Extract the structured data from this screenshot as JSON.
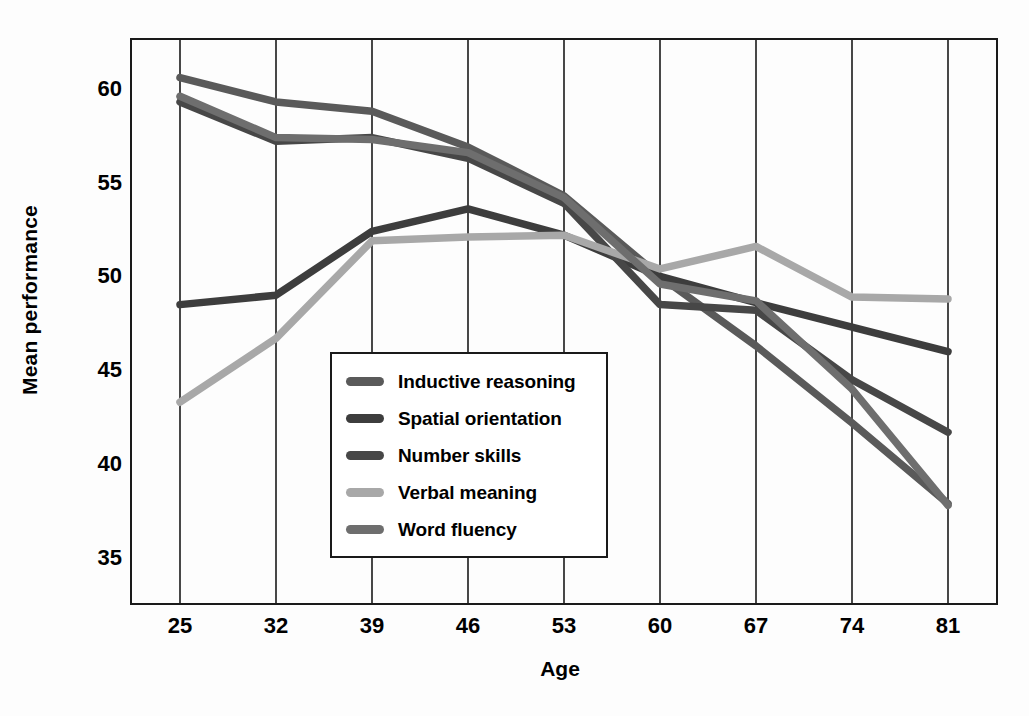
{
  "chart_data": {
    "type": "line",
    "title": "",
    "xlabel": "Age",
    "ylabel": "Mean performance",
    "categories": [
      25,
      32,
      39,
      46,
      53,
      60,
      67,
      74,
      81
    ],
    "x": [
      25,
      32,
      39,
      46,
      53,
      60,
      67,
      74,
      81
    ],
    "xlim": [
      21.5,
      84.5
    ],
    "ylim": [
      32.6,
      62.6
    ],
    "yticks": [
      35,
      40,
      45,
      50,
      55,
      60
    ],
    "xticks": [
      25,
      32,
      39,
      46,
      53,
      60,
      67,
      74,
      81
    ],
    "grid": "vertical-only",
    "legend_position": "center-left-inside",
    "series": [
      {
        "name": "Inductive reasoning",
        "color": "#5a5a5a",
        "values": [
          60.6,
          59.3,
          58.8,
          56.9,
          54.3,
          50.0,
          46.3,
          42.2,
          37.9
        ]
      },
      {
        "name": "Spatial orientation",
        "color": "#3d3d3d",
        "values": [
          48.5,
          49.0,
          52.4,
          53.6,
          52.2,
          50.0,
          48.6,
          47.3,
          46.0
        ]
      },
      {
        "name": "Number skills",
        "color": "#474747",
        "values": [
          59.3,
          57.2,
          57.4,
          56.3,
          53.9,
          48.5,
          48.2,
          44.5,
          41.7
        ]
      },
      {
        "name": "Verbal meaning",
        "color": "#a8a8a8",
        "values": [
          43.3,
          46.7,
          51.9,
          52.1,
          52.2,
          50.4,
          51.6,
          48.9,
          48.8
        ]
      },
      {
        "name": "Word fluency",
        "color": "#6e6e6e",
        "values": [
          59.6,
          57.4,
          57.3,
          56.6,
          54.2,
          49.6,
          48.7,
          44.0,
          37.8
        ]
      }
    ]
  },
  "legend": {
    "items": [
      {
        "label": "Inductive reasoning"
      },
      {
        "label": "Spatial orientation"
      },
      {
        "label": "Number skills"
      },
      {
        "label": "Verbal meaning"
      },
      {
        "label": "Word fluency"
      }
    ]
  },
  "axes": {
    "y_title": "Mean performance",
    "x_title": "Age",
    "y_tick_labels": [
      "60",
      "55",
      "50",
      "45",
      "40",
      "35"
    ],
    "x_tick_labels": [
      "25",
      "32",
      "39",
      "46",
      "53",
      "60",
      "67",
      "74",
      "81"
    ]
  }
}
